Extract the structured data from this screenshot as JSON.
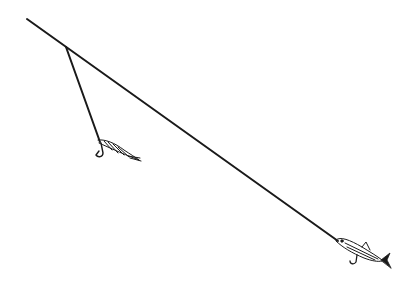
{
  "illustration": {
    "title": "Fishing rig with dropper fly and baitfish",
    "background": "#ffffff",
    "ink_color": "#1a1a1a",
    "main_line": {
      "x1": 27,
      "y1": 19,
      "x2": 338,
      "y2": 241
    },
    "dropper_line": {
      "x1": 66,
      "y1": 47,
      "x2": 100,
      "y2": 142
    },
    "fly": {
      "x": 100,
      "y": 142
    },
    "baitfish": {
      "x": 337,
      "y": 241
    }
  }
}
